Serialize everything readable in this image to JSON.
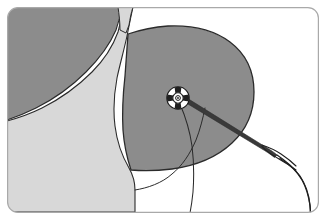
{
  "figure": {
    "title": "Surgical suture needle entering breast tissue at marked target point",
    "width": 326,
    "height": 220,
    "background_color": "#ffffff"
  },
  "frame": {
    "name": "rounded-panel-border",
    "x": 7,
    "y": 7,
    "width": 312,
    "height": 206,
    "corner_radius": 11,
    "stroke_color": "#a9a9a9",
    "stroke_width": 1.2,
    "fill_color": "#ffffff"
  },
  "palette": {
    "dark_gray": "#8c8c8c",
    "mid_gray": "#909090",
    "light_gray": "#d8d8d8",
    "white": "#ffffff",
    "outline": "#2b2b2b",
    "border_gray": "#a9a9a9",
    "needle_dark": "#3a3a3a",
    "thread_dark": "#1f1f1f"
  },
  "regions": [
    {
      "name": "chest-wall-upper-left",
      "label": "Chest wall / upper torso (shaded)",
      "fill": "#8c8c8c",
      "stroke": "#2b2b2b",
      "stroke_width": 1.1
    },
    {
      "name": "neck-shoulder-light",
      "label": "Neck and shoulder (light shading)",
      "fill": "#d8d8d8",
      "stroke": "#2b2b2b",
      "stroke_width": 1.1
    },
    {
      "name": "breast-mass",
      "label": "Breast mass (shaded)",
      "fill": "#8c8c8c",
      "stroke": "#2b2b2b",
      "stroke_width": 1.3
    },
    {
      "name": "inframammary-fold",
      "label": "Inframammary fold contour line",
      "fill": "none",
      "stroke": "#2b2b2b",
      "stroke_width": 1.0
    }
  ],
  "instruments": {
    "needle": {
      "name": "suture-needle",
      "label": "Suture needle",
      "color": "#3a3a3a",
      "tip_x": 186,
      "tip_y": 99,
      "heel_x": 286,
      "heel_y": 158
    },
    "thread": {
      "name": "suture-thread",
      "label": "Suture thread",
      "color": "#1f1f1f",
      "stroke_width": 1.1
    },
    "thread_loop": {
      "name": "needle-eye-loop",
      "label": "Needle eye / thread loop",
      "center_x": 272,
      "center_y": 151
    },
    "tissue_thread": {
      "name": "tissue-suture-strand",
      "label": "Suture strand passing through tissue",
      "color": "#2b2b2b",
      "stroke_width": 1.0
    }
  },
  "marker": {
    "name": "target-marker",
    "label": "Target entry point marker",
    "center_x": 178,
    "center_y": 98,
    "outer_radius": 11.5,
    "ring_color": "#ffffff",
    "segment_color": "#202020",
    "core_color": "#ffffff",
    "core_ring_color": "#1a1a1a",
    "segments": 4,
    "segment_positions": [
      "north",
      "east",
      "south",
      "west"
    ]
  }
}
